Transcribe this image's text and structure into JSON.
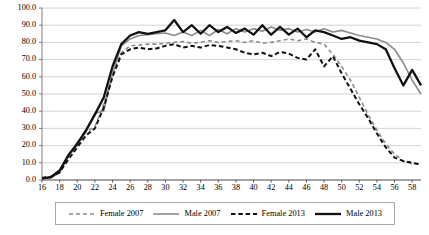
{
  "chart_data": {
    "type": "line",
    "title": "",
    "subtitle": "",
    "xlabel": "",
    "ylabel": "",
    "xlim": [
      16,
      59
    ],
    "ylim": [
      0,
      100
    ],
    "grid": "horizontal",
    "legend_position": "bottom",
    "x": [
      16,
      17,
      18,
      19,
      20,
      21,
      22,
      23,
      24,
      25,
      26,
      27,
      28,
      29,
      30,
      31,
      32,
      33,
      34,
      35,
      36,
      37,
      38,
      39,
      40,
      41,
      42,
      43,
      44,
      45,
      46,
      47,
      48,
      49,
      50,
      51,
      52,
      53,
      54,
      55,
      56,
      57,
      58,
      59
    ],
    "xticklabels": [
      "16",
      "18",
      "20",
      "22",
      "24",
      "26",
      "28",
      "30",
      "32",
      "34",
      "36",
      "38",
      "40",
      "42",
      "44",
      "46",
      "48",
      "50",
      "52",
      "54",
      "56",
      "58"
    ],
    "yticklabels": [
      "0.0",
      "10.0",
      "20.0",
      "30.0",
      "40.0",
      "50.0",
      "60.0",
      "70.0",
      "80.0",
      "90.0",
      "100.0"
    ],
    "series": [
      {
        "name": "Female 2007",
        "color": "#8c8c8c",
        "style": "dashed",
        "width": 1.6,
        "values": [
          1.5,
          2.0,
          5.0,
          13.0,
          20.0,
          28.0,
          31.0,
          44.0,
          62.0,
          74.0,
          78.0,
          78.5,
          79.0,
          79.0,
          79.5,
          80.0,
          80.5,
          79.5,
          80.0,
          81.0,
          80.0,
          80.5,
          81.0,
          80.0,
          81.0,
          79.5,
          80.0,
          81.0,
          82.0,
          81.0,
          82.0,
          80.0,
          79.0,
          73.0,
          66.0,
          58.0,
          48.0,
          38.0,
          29.0,
          21.0,
          15.0,
          11.0,
          9.5,
          9.0
        ]
      },
      {
        "name": "Male 2007",
        "color": "#8c8c8c",
        "style": "solid",
        "width": 1.6,
        "values": [
          1.0,
          1.5,
          4.0,
          14.0,
          22.0,
          28.0,
          39.0,
          40.0,
          62.0,
          78.0,
          82.0,
          84.0,
          84.5,
          85.0,
          85.5,
          84.0,
          86.0,
          84.0,
          87.0,
          84.0,
          87.5,
          85.0,
          88.0,
          86.0,
          88.0,
          86.5,
          89.0,
          87.0,
          88.0,
          86.0,
          87.5,
          86.0,
          88.0,
          86.0,
          87.0,
          85.5,
          84.0,
          83.0,
          82.0,
          80.0,
          76.0,
          68.0,
          58.0,
          50.0
        ]
      },
      {
        "name": "Female 2013",
        "color": "#111111",
        "style": "dashed",
        "width": 2.0,
        "values": [
          1.2,
          1.8,
          4.5,
          12.0,
          19.0,
          26.0,
          30.0,
          42.0,
          60.0,
          73.0,
          76.0,
          77.0,
          76.0,
          76.5,
          78.0,
          79.0,
          77.0,
          78.0,
          77.0,
          78.5,
          78.0,
          77.0,
          76.0,
          74.0,
          73.0,
          74.0,
          72.0,
          74.5,
          73.5,
          71.0,
          70.0,
          76.0,
          66.0,
          72.0,
          62.0,
          53.0,
          44.0,
          36.0,
          27.0,
          19.0,
          13.0,
          11.0,
          10.0,
          9.0
        ]
      },
      {
        "name": "Male 2013",
        "color": "#111111",
        "style": "solid",
        "width": 2.3,
        "values": [
          1.0,
          1.6,
          5.5,
          14.5,
          21.0,
          29.0,
          38.0,
          48.0,
          66.0,
          79.0,
          84.0,
          86.0,
          85.0,
          86.0,
          87.0,
          93.0,
          86.0,
          90.0,
          85.0,
          90.0,
          86.0,
          89.0,
          85.5,
          88.0,
          84.5,
          90.0,
          84.5,
          89.0,
          84.5,
          88.0,
          83.0,
          87.0,
          86.0,
          84.0,
          82.0,
          83.0,
          81.0,
          80.0,
          79.0,
          76.0,
          65.0,
          55.0,
          64.0,
          55.0
        ]
      }
    ]
  },
  "legend": {
    "items": [
      {
        "label": "Female 2007"
      },
      {
        "label": "Male 2007"
      },
      {
        "label": "Female 2013"
      },
      {
        "label": "Male 2013"
      }
    ]
  }
}
